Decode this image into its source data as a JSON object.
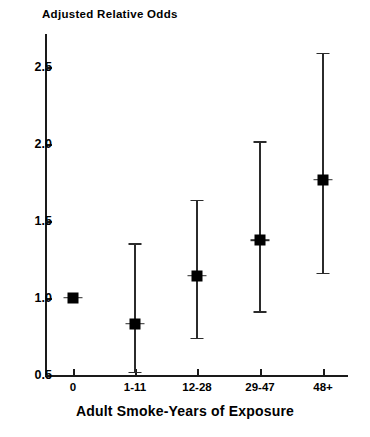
{
  "chart_data": {
    "type": "scatter",
    "title": "Adjusted Relative Odds",
    "xlabel": "Adult Smoke-Years of Exposure",
    "ylabel": "Adjusted Relative Odds",
    "grid": false,
    "legend": "none",
    "ylim": [
      0.5,
      2.7
    ],
    "yticks": [
      "0.5",
      "1.0",
      "1.5",
      "2.0",
      "2.5"
    ],
    "ytick_values": [
      0.5,
      1.0,
      1.5,
      2.0,
      2.5
    ],
    "categories": [
      "0",
      "1-11",
      "12-28",
      "29-47",
      "48+"
    ],
    "values": [
      1.0,
      0.83,
      1.14,
      1.37,
      1.76
    ],
    "ci_low": [
      1.0,
      0.52,
      0.74,
      0.91,
      1.16
    ],
    "ci_high": [
      1.0,
      1.35,
      1.63,
      2.01,
      2.58
    ],
    "points": [
      {
        "category": "0",
        "estimate": 1.0,
        "ci_low": 1.0,
        "ci_high": 1.0,
        "reference": true
      },
      {
        "category": "1-11",
        "estimate": 0.83,
        "ci_low": 0.52,
        "ci_high": 1.35,
        "reference": false
      },
      {
        "category": "12-28",
        "estimate": 1.14,
        "ci_low": 0.74,
        "ci_high": 1.63,
        "reference": false
      },
      {
        "category": "29-47",
        "estimate": 1.37,
        "ci_low": 0.91,
        "ci_high": 2.01,
        "reference": false
      },
      {
        "category": "48+",
        "estimate": 1.76,
        "ci_low": 1.16,
        "ci_high": 2.58,
        "reference": false
      }
    ],
    "colors": {
      "marker": "#000000",
      "whisker": "#2b2b2b",
      "axis": "#1a1a1a",
      "background": "#ffffff"
    }
  },
  "axis": {
    "y_labels": [
      "2.5",
      "2.0",
      "1.5",
      "1.0",
      "0.5"
    ],
    "x_labels": [
      "0",
      "1-11",
      "12-28",
      "29-47",
      "48+"
    ]
  }
}
